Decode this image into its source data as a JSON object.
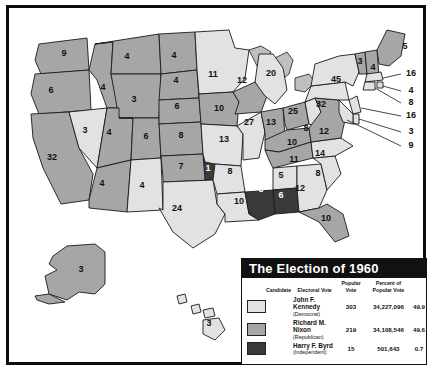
{
  "legend": {
    "title": "The Election of 1960",
    "columns": {
      "candidate": "Candidate",
      "electoral_vote": "Electoral Vote",
      "popular_vote": "Popular Vote",
      "percent": "Percent of Popular Vote"
    },
    "rows": [
      {
        "name": "John F. Kennedy",
        "party": "(Democrat)",
        "electoral": "303",
        "popular": "34,227,096",
        "percent": "49.9",
        "swatch": "kennedy-swatch",
        "color": "#e2e2e2"
      },
      {
        "name": "Richard M. Nixon",
        "party": "(Republican)",
        "electoral": "219",
        "popular": "34,108,546",
        "percent": "49.6",
        "swatch": "nixon-swatch",
        "color": "#a6a6a6"
      },
      {
        "name": "Harry F. Byrd",
        "party": "(Independent)",
        "electoral": "15",
        "popular": "501,643",
        "percent": "0.7",
        "swatch": "byrd-swatch",
        "color": "#3a3a3a"
      }
    ]
  },
  "map": {
    "states": [
      {
        "code": "WA",
        "ev": "9",
        "winner": "nixon",
        "x": 55,
        "y": 48
      },
      {
        "code": "OR",
        "ev": "6",
        "winner": "nixon",
        "x": 42,
        "y": 85
      },
      {
        "code": "CA",
        "ev": "32",
        "winner": "nixon",
        "x": 43,
        "y": 152
      },
      {
        "code": "NV",
        "ev": "3",
        "winner": "kennedy",
        "x": 76,
        "y": 125
      },
      {
        "code": "ID",
        "ev": "4",
        "winner": "nixon",
        "x": 94,
        "y": 82
      },
      {
        "code": "MT",
        "ev": "4",
        "winner": "nixon",
        "x": 118,
        "y": 51
      },
      {
        "code": "WY",
        "ev": "3",
        "winner": "nixon",
        "x": 125,
        "y": 94
      },
      {
        "code": "UT",
        "ev": "4",
        "winner": "nixon",
        "x": 100,
        "y": 127
      },
      {
        "code": "AZ",
        "ev": "4",
        "winner": "nixon",
        "x": 93,
        "y": 178
      },
      {
        "code": "CO",
        "ev": "6",
        "winner": "nixon",
        "x": 137,
        "y": 131
      },
      {
        "code": "NM",
        "ev": "4",
        "winner": "kennedy",
        "x": 133,
        "y": 180
      },
      {
        "code": "ND",
        "ev": "4",
        "winner": "nixon",
        "x": 165,
        "y": 50
      },
      {
        "code": "SD",
        "ev": "4",
        "winner": "nixon",
        "x": 167,
        "y": 75
      },
      {
        "code": "NE",
        "ev": "6",
        "winner": "nixon",
        "x": 168,
        "y": 101
      },
      {
        "code": "KS",
        "ev": "8",
        "winner": "nixon",
        "x": 172,
        "y": 130
      },
      {
        "code": "OK",
        "ev": "7",
        "winner": "nixon",
        "x": 172,
        "y": 161
      },
      {
        "code": "OK2",
        "ev": "1",
        "winner": "byrd",
        "x": 199,
        "y": 163
      },
      {
        "code": "TX",
        "ev": "24",
        "winner": "kennedy",
        "x": 168,
        "y": 203
      },
      {
        "code": "MN",
        "ev": "11",
        "winner": "kennedy",
        "x": 204,
        "y": 69
      },
      {
        "code": "IA",
        "ev": "10",
        "winner": "nixon",
        "x": 210,
        "y": 103
      },
      {
        "code": "MO",
        "ev": "13",
        "winner": "kennedy",
        "x": 215,
        "y": 134
      },
      {
        "code": "AR",
        "ev": "8",
        "winner": "kennedy",
        "x": 221,
        "y": 166
      },
      {
        "code": "LA",
        "ev": "10",
        "winner": "kennedy",
        "x": 230,
        "y": 196
      },
      {
        "code": "WI",
        "ev": "12",
        "winner": "nixon",
        "x": 233,
        "y": 75
      },
      {
        "code": "IL",
        "ev": "27",
        "winner": "kennedy",
        "x": 240,
        "y": 117
      },
      {
        "code": "MS",
        "ev": "8",
        "winner": "byrd",
        "x": 252,
        "y": 184
      },
      {
        "code": "MI",
        "ev": "20",
        "winner": "kennedy",
        "x": 262,
        "y": 68
      },
      {
        "code": "IN",
        "ev": "13",
        "winner": "nixon",
        "x": 262,
        "y": 117
      },
      {
        "code": "AL1",
        "ev": "5",
        "winner": "kennedy",
        "x": 272,
        "y": 170
      },
      {
        "code": "AL2",
        "ev": "6",
        "winner": "byrd",
        "x": 272,
        "y": 190
      },
      {
        "code": "OH",
        "ev": "25",
        "winner": "nixon",
        "x": 284,
        "y": 106
      },
      {
        "code": "KY",
        "ev": "10",
        "winner": "nixon",
        "x": 283,
        "y": 137
      },
      {
        "code": "TN",
        "ev": "11",
        "winner": "nixon",
        "x": 285,
        "y": 154
      },
      {
        "code": "GA",
        "ev": "12",
        "winner": "kennedy",
        "x": 291,
        "y": 183
      },
      {
        "code": "FL",
        "ev": "10",
        "winner": "nixon",
        "x": 317,
        "y": 213
      },
      {
        "code": "SC",
        "ev": "8",
        "winner": "kennedy",
        "x": 309,
        "y": 168
      },
      {
        "code": "NC",
        "ev": "14",
        "winner": "kennedy",
        "x": 311,
        "y": 148
      },
      {
        "code": "WV",
        "ev": "8",
        "winner": "kennedy",
        "x": 297,
        "y": 123
      },
      {
        "code": "VA",
        "ev": "12",
        "winner": "nixon",
        "x": 315,
        "y": 126
      },
      {
        "code": "PA",
        "ev": "32",
        "winner": "kennedy",
        "x": 312,
        "y": 99
      },
      {
        "code": "NY",
        "ev": "45",
        "winner": "kennedy",
        "x": 327,
        "y": 74
      },
      {
        "code": "VT",
        "ev": "3",
        "winner": "nixon",
        "x": 351,
        "y": 56
      },
      {
        "code": "NH",
        "ev": "4",
        "winner": "nixon",
        "x": 364,
        "y": 62
      },
      {
        "code": "ME",
        "ev": "5",
        "winner": "nixon",
        "x": 396,
        "y": 41
      },
      {
        "code": "AK",
        "ev": "3",
        "winner": "nixon",
        "x": 72,
        "y": 264
      },
      {
        "code": "HI",
        "ev": "3",
        "winner": "kennedy",
        "x": 200,
        "y": 318
      }
    ],
    "callouts": [
      {
        "code": "MA",
        "ev": "16",
        "winner": "kennedy",
        "x": 402,
        "y": 68
      },
      {
        "code": "RI",
        "ev": "4",
        "winner": "kennedy",
        "x": 402,
        "y": 85
      },
      {
        "code": "CT",
        "ev": "8",
        "winner": "kennedy",
        "x": 402,
        "y": 97
      },
      {
        "code": "NJ",
        "ev": "16",
        "winner": "kennedy",
        "x": 402,
        "y": 110
      },
      {
        "code": "DE",
        "ev": "3",
        "winner": "kennedy",
        "x": 402,
        "y": 126
      },
      {
        "code": "MD",
        "ev": "9",
        "winner": "kennedy",
        "x": 402,
        "y": 140
      }
    ]
  }
}
